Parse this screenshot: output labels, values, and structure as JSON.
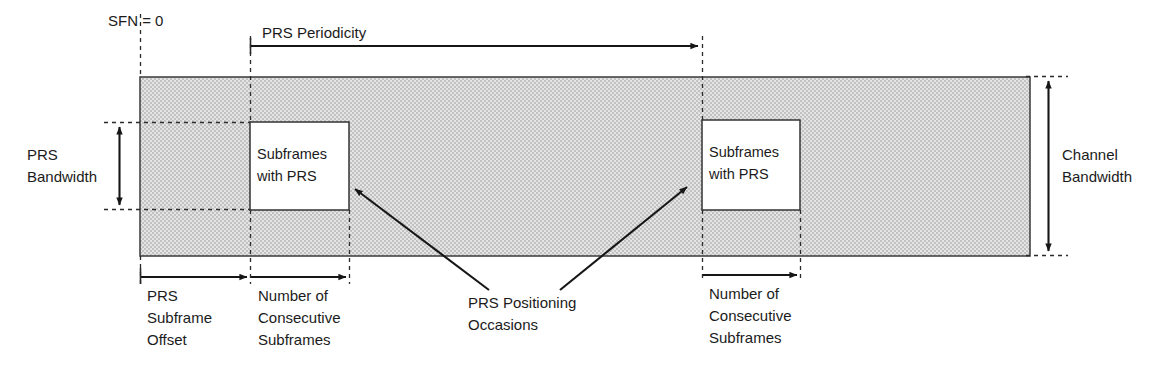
{
  "diagram": {
    "colors": {
      "band_fill": "#d6d6d6",
      "box_fill": "#ffffff",
      "stroke": "#2a2a2a",
      "text": "#1b1b1b"
    },
    "labels": {
      "sfn_zero": "SFN = 0",
      "prs_periodicity": "PRS Periodicity",
      "prs_bandwidth_line1": "PRS",
      "prs_bandwidth_line2": "Bandwidth",
      "channel_bandwidth_line1": "Channel",
      "channel_bandwidth_line2": "Bandwidth",
      "subframes_with_prs_line1": "Subframes",
      "subframes_with_prs_line2": "with PRS",
      "prs_subframe_offset_line1": "PRS",
      "prs_subframe_offset_line2": "Subframe",
      "prs_subframe_offset_line3": "Offset",
      "number_consecutive_line1": "Number of",
      "number_consecutive_line2": "Consecutive",
      "number_consecutive_line3": "Subframes",
      "prs_positioning_occasions_line1": "PRS Positioning",
      "prs_positioning_occasions_line2": "Occasions"
    },
    "occasions": [
      {
        "index": 1,
        "box_label_line1": "Subframes",
        "box_label_line2": "with PRS",
        "consecutive_label_line1": "Number of",
        "consecutive_label_line2": "Consecutive",
        "consecutive_label_line3": "Subframes"
      },
      {
        "index": 2,
        "box_label_line1": "Subframes",
        "box_label_line2": "with PRS",
        "consecutive_label_line1": "Number of",
        "consecutive_label_line2": "Consecutive",
        "consecutive_label_line3": "Subframes"
      }
    ]
  }
}
